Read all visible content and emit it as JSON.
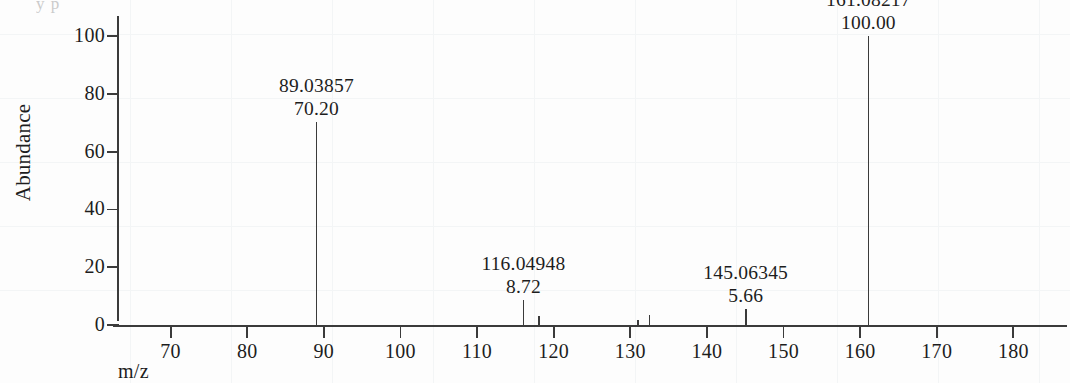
{
  "figure": {
    "clipped_caption": "y p",
    "background_color": "#fdfdfd",
    "line_color": "#3b3b3b"
  },
  "chart_data": {
    "type": "bar",
    "title": "",
    "subtitle": "",
    "xlabel": "m/z",
    "ylabel": "Abundance",
    "xlim": [
      63,
      187
    ],
    "ylim": [
      0,
      107
    ],
    "grid": false,
    "legend": "none",
    "x_ticks": [
      70,
      80,
      90,
      100,
      110,
      120,
      130,
      140,
      150,
      160,
      170,
      180
    ],
    "y_ticks": [
      0,
      20,
      40,
      60,
      80,
      100
    ],
    "x_tick_labels": [
      "70",
      "80",
      "90",
      "100",
      "110",
      "120",
      "130",
      "140",
      "150",
      "160",
      "170",
      "180"
    ],
    "y_tick_labels": [
      "0",
      "20",
      "40",
      "60",
      "80",
      "100"
    ],
    "x": [
      89.03857,
      116.04948,
      118.05,
      131.0,
      132.5,
      145.06345,
      161.08217
    ],
    "values": [
      70.2,
      8.72,
      3.1,
      1.6,
      3.6,
      5.66,
      100.0
    ],
    "peaks": [
      {
        "mz": 89.03857,
        "intensity": 70.2,
        "mz_label": "89.03857",
        "intensity_label": "70.20",
        "labeled": true
      },
      {
        "mz": 116.04948,
        "intensity": 8.72,
        "mz_label": "116.04948",
        "intensity_label": "8.72",
        "labeled": true
      },
      {
        "mz": 118.05,
        "intensity": 3.1,
        "mz_label": "",
        "intensity_label": "",
        "labeled": false
      },
      {
        "mz": 131.0,
        "intensity": 1.6,
        "mz_label": "",
        "intensity_label": "",
        "labeled": false
      },
      {
        "mz": 132.5,
        "intensity": 3.6,
        "mz_label": "",
        "intensity_label": "",
        "labeled": false
      },
      {
        "mz": 145.06345,
        "intensity": 5.66,
        "mz_label": "145.06345",
        "intensity_label": "5.66",
        "labeled": true
      },
      {
        "mz": 161.08217,
        "intensity": 100.0,
        "mz_label": "161.08217",
        "intensity_label": "100.00",
        "labeled": true
      }
    ]
  }
}
